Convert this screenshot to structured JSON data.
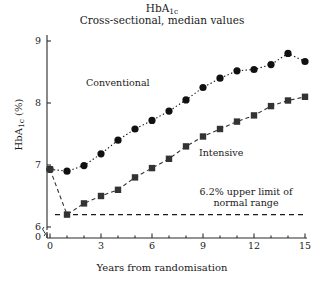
{
  "chart_data": {
    "type": "line",
    "title": "HbA1c",
    "title_main": "HbA",
    "title_sub": "1c",
    "subtitle": "Cross-sectional, median values",
    "xlabel": "Years from randomisation",
    "ylabel_main": "HbA",
    "ylabel_sub": "1c",
    "ylabel_unit": " (%)",
    "ylabel": "HbA1c (%)",
    "xlim": [
      0,
      15
    ],
    "ylim": [
      6,
      9
    ],
    "y_axis_break": true,
    "y_break_label": "0",
    "grid": false,
    "legend_position": "inline-annotations",
    "xticks": [
      "0",
      "3",
      "6",
      "9",
      "12",
      "15"
    ],
    "xtick_values": [
      0,
      3,
      6,
      9,
      12,
      15
    ],
    "xminor_step": 1,
    "yticks": [
      "6",
      "7",
      "8",
      "9"
    ],
    "ytick_values": [
      6,
      7,
      8,
      9
    ],
    "x": [
      0,
      1,
      2,
      3,
      4,
      5,
      6,
      7,
      8,
      9,
      10,
      11,
      12,
      13,
      14,
      15
    ],
    "series": [
      {
        "name": "Conventional",
        "marker": "circle",
        "linestyle": "dotted",
        "color": "#111111",
        "values": [
          6.93,
          6.9,
          6.99,
          7.18,
          7.4,
          7.58,
          7.72,
          7.87,
          8.05,
          8.25,
          8.4,
          8.52,
          8.54,
          8.62,
          8.8,
          8.67
        ]
      },
      {
        "name": "Intensive",
        "marker": "square",
        "linestyle": "dashed",
        "color": "#333333",
        "values": [
          6.93,
          6.2,
          6.38,
          6.5,
          6.6,
          6.8,
          6.95,
          7.1,
          7.3,
          7.46,
          7.58,
          7.7,
          7.8,
          7.95,
          8.04,
          8.1
        ]
      }
    ],
    "reference_line": {
      "value": 6.2,
      "linestyle": "dashed",
      "label_line1": "6.2% upper limit of",
      "label_line2": "normal range",
      "label": "6.2% upper limit of normal range"
    },
    "annotations": [
      {
        "name": "conventional-label",
        "text": "Conventional"
      },
      {
        "name": "intensive-label",
        "text": "Intensive"
      }
    ]
  },
  "caption": {
    "clipped_text": ""
  }
}
